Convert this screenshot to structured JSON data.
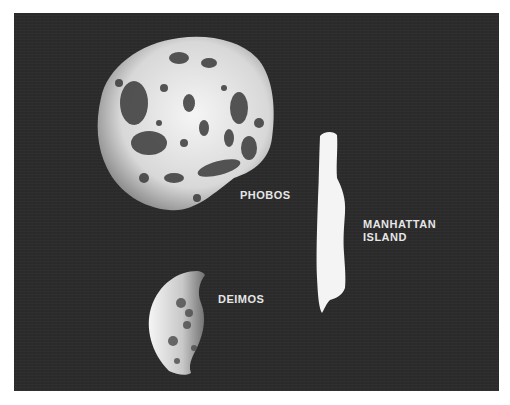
{
  "figure": {
    "labels": {
      "phobos": "PHOBOS",
      "deimos": "DEIMOS",
      "manhattan_line1": "MANHATTAN",
      "manhattan_line2": "ISLAND"
    },
    "colors": {
      "background": "#2b2b2b",
      "object": "#f2f2f2",
      "label": "#e6e6e6"
    }
  }
}
